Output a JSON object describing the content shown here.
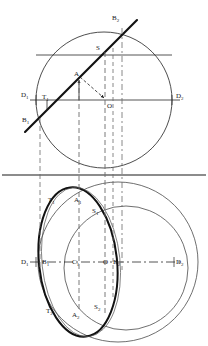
{
  "drawing": {
    "type": "descriptive-geometry-projection",
    "title": "Two-view orthographic projection of a circle inclined to the horizontal plane",
    "canvas": {
      "width": 208,
      "height": 346
    },
    "colors": {
      "line_main": "#1a1a1a",
      "line_thin": "#4a4a4a",
      "line_construction": "#6b6b6b",
      "background": "#ffffff"
    },
    "views": {
      "front": {
        "name": "front-view",
        "circle": {
          "cx": 104,
          "cy": 100,
          "r": 68
        },
        "axis_line": {
          "y": 100,
          "x1": 30,
          "x2": 180
        },
        "chord_line": {
          "y": 55,
          "x1": 36,
          "x2": 172
        },
        "oblique_line": {
          "x1": 25,
          "y1": 132,
          "x2": 137,
          "y2": 20
        }
      },
      "ground_line": {
        "y": 175,
        "x1": 2,
        "x2": 206
      },
      "top": {
        "name": "top-view",
        "outer_circle": {
          "cx": 118,
          "cy": 262,
          "r": 80
        },
        "inner_circle": {
          "cx": 126,
          "cy": 268,
          "r": 62
        },
        "ellipse": {
          "cx": 78,
          "cy": 262,
          "rx": 39,
          "ry": 75,
          "rotation": -6
        },
        "axis_line": {
          "y": 262,
          "x1": 30,
          "x2": 182
        }
      }
    },
    "projection_lines": [
      {
        "name": "projector-B1",
        "x": 40,
        "y1": 118,
        "y2": 268
      },
      {
        "name": "projector-A",
        "x": 79,
        "y1": 80,
        "y2": 310
      },
      {
        "name": "projector-S-left",
        "x": 105,
        "y1": 52,
        "y2": 312
      },
      {
        "name": "projector-S-right",
        "x": 113,
        "y1": 48,
        "y2": 300
      },
      {
        "name": "projector-B2",
        "x": 122,
        "y1": 28,
        "y2": 270
      }
    ],
    "labels": {
      "front": [
        {
          "id": "front-label-B2",
          "base": "B",
          "sub": "2",
          "x": 112,
          "y": 20
        },
        {
          "id": "front-label-S",
          "base": "S",
          "sub": "",
          "x": 96,
          "y": 50
        },
        {
          "id": "front-label-A",
          "base": "A",
          "sub": "",
          "x": 74,
          "y": 76
        },
        {
          "id": "front-label-D1",
          "base": "D",
          "sub": "1",
          "x": 21,
          "y": 97
        },
        {
          "id": "front-label-T1",
          "base": "T",
          "sub": "1",
          "x": 42,
          "y": 99
        },
        {
          "id": "front-label-O",
          "base": "O",
          "sub": "",
          "x": 107,
          "y": 108
        },
        {
          "id": "front-label-D2",
          "base": "D",
          "sub": "2",
          "x": 176,
          "y": 98
        },
        {
          "id": "front-label-B1",
          "base": "B",
          "sub": "1",
          "x": 22,
          "y": 122
        }
      ],
      "top": [
        {
          "id": "top-label-T1",
          "base": "T",
          "sub": "1",
          "x": 48,
          "y": 202
        },
        {
          "id": "top-label-A1",
          "base": "A",
          "sub": "1",
          "x": 74,
          "y": 202
        },
        {
          "id": "top-label-S1",
          "base": "S",
          "sub": "1",
          "x": 92,
          "y": 213
        },
        {
          "id": "top-label-D1",
          "base": "D",
          "sub": "1",
          "x": 21,
          "y": 264
        },
        {
          "id": "top-label-B1",
          "base": "B",
          "sub": "1",
          "x": 42,
          "y": 264
        },
        {
          "id": "top-label-C1",
          "base": "C",
          "sub": "1",
          "x": 72,
          "y": 264
        },
        {
          "id": "top-label-O",
          "base": "O",
          "sub": "",
          "x": 104,
          "y": 264
        },
        {
          "id": "top-label-B2",
          "base": "B",
          "sub": "2",
          "x": 114,
          "y": 264
        },
        {
          "id": "top-label-D2",
          "base": "D",
          "sub": "2",
          "x": 176,
          "y": 264
        },
        {
          "id": "top-label-T2",
          "base": "T",
          "sub": "2",
          "x": 46,
          "y": 313
        },
        {
          "id": "top-label-A2",
          "base": "A",
          "sub": "2",
          "x": 72,
          "y": 316
        },
        {
          "id": "top-label-S2",
          "base": "S",
          "sub": "2",
          "x": 94,
          "y": 309
        }
      ]
    },
    "tick_marks": [
      {
        "name": "tick-T1-front",
        "x": 47,
        "y1": 100,
        "y2": 110
      },
      {
        "name": "tick-D1-front",
        "x": 36,
        "y1": 96,
        "y2": 104
      },
      {
        "name": "tick-D2-front",
        "x": 172,
        "y1": 96,
        "y2": 104
      }
    ],
    "arrows": [
      {
        "name": "arrow-to-A",
        "x1": 79,
        "y1": 100,
        "x2": 79,
        "y2": 78
      },
      {
        "name": "arrow-A-to-O",
        "x1": 79,
        "y1": 78,
        "x2": 105,
        "y2": 100
      }
    ]
  }
}
